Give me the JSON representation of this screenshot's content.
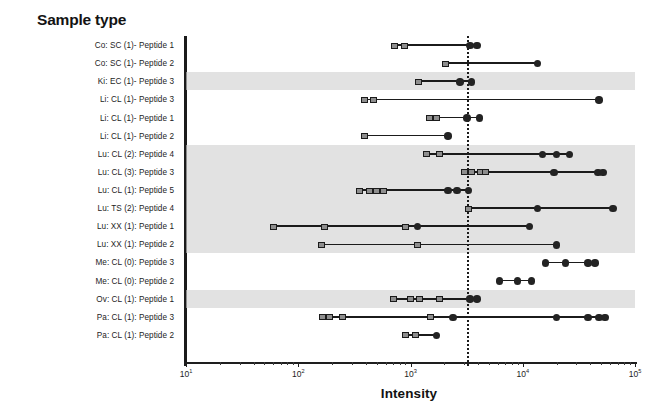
{
  "panel": {
    "title": "Sample type"
  },
  "axis": {
    "x_title": "Intensity",
    "x_scale": "log10",
    "x_min_exp": 1,
    "x_max_exp": 5,
    "x_ticklabels": [
      "10",
      "10",
      "10",
      "10",
      "10"
    ],
    "x_tick_exponents": [
      "1",
      "2",
      "3",
      "4",
      "5"
    ],
    "reference_line_value": 3200
  },
  "style": {
    "band_color": "#d0d0d0",
    "square_fill": "#8e8e8e",
    "square_stroke": "#1b1b1b",
    "circle_fill": "#232323",
    "line_color": "#1b1b1b",
    "refline_color": "#1b1b1b"
  },
  "chart_data": {
    "type": "scatter",
    "title": "Sample type",
    "xlabel": "Intensity",
    "ylabel": "",
    "xscale": "log",
    "xlim": [
      10,
      100000
    ],
    "grid": false,
    "legend": false,
    "reference_line": 3200,
    "marker_kinds": {
      "square": "below-threshold / low replicate",
      "circle": "above-threshold / high replicate"
    },
    "categories": [
      "Co: SC (1)- Peptide 1",
      "Co: SC (1)- Peptide 2",
      "Ki: EC (1)- Peptide 3",
      "Li: CL (1)- Peptide 3",
      "Li: CL (1)- Peptide 1",
      "Li: CL (1)- Peptide 2",
      "Lu: CL (2): Peptide 4",
      "Lu: CL (3): Peptide 3",
      "Lu: CL (1): Peptide 5",
      "Lu: TS (2): Peptide 4",
      "Lu: XX (1): Peptide 1",
      "Lu: XX (1): Peptide 2",
      "Me: CL (0): Peptide 3",
      "Me: CL (0): Peptide 2",
      "Ov: CL (1): Peptide 1",
      "Pa: CL (1): Peptide 3",
      "Pa: CL (1): Peptide 2"
    ],
    "shaded_rows": [
      2,
      6,
      7,
      8,
      9,
      10,
      11,
      14
    ],
    "rows": [
      {
        "category": "Co: SC (1)- Peptide 1",
        "squares": [
          720,
          880
        ],
        "circles": [
          3400,
          3900
        ],
        "line": [
          720,
          3900
        ]
      },
      {
        "category": "Co: SC (1)- Peptide 2",
        "squares": [
          2050
        ],
        "circles": [
          13500
        ],
        "line": [
          2050,
          13500
        ]
      },
      {
        "category": "Ki: EC (1)- Peptide 3",
        "squares": [
          1180
        ],
        "circles": [
          2750,
          3500
        ],
        "line": [
          1180,
          3500
        ]
      },
      {
        "category": "Li: CL (1)- Peptide 3",
        "squares": [
          390,
          470
        ],
        "circles": [
          48000
        ],
        "line": [
          390,
          48000
        ]
      },
      {
        "category": "Li: CL (1)- Peptide 1",
        "squares": [
          1480,
          1700
        ],
        "circles": [
          3200,
          4100
        ],
        "line": [
          1480,
          4100
        ]
      },
      {
        "category": "Li: CL (1)- Peptide 2",
        "squares": [
          390
        ],
        "circles": [
          2150
        ],
        "line": [
          390,
          2150
        ]
      },
      {
        "category": "Lu: CL (2): Peptide 4",
        "squares": [
          1400,
          1800
        ],
        "circles": [
          15000,
          20000,
          26000
        ],
        "line": [
          1400,
          26000
        ]
      },
      {
        "category": "Lu: CL (3): Peptide 3",
        "squares": [
          3000,
          3500,
          4200,
          4700
        ],
        "circles": [
          19000,
          47000,
          52000
        ],
        "line": [
          3000,
          52000
        ]
      },
      {
        "category": "Lu: CL (1): Peptide 5",
        "squares": [
          350,
          430,
          500,
          570
        ],
        "circles": [
          2150,
          2600,
          3300
        ],
        "line": [
          350,
          3300
        ]
      },
      {
        "category": "Lu: TS (2): Peptide 4",
        "squares": [
          3300
        ],
        "circles": [
          13500,
          64000
        ],
        "line": [
          3300,
          64000
        ]
      },
      {
        "category": "Lu: XX (1): Peptide 1",
        "squares": [
          60,
          170,
          900
        ],
        "circles": [
          1150,
          11500
        ],
        "line": [
          60,
          11500
        ]
      },
      {
        "category": "Lu: XX (1): Peptide 2",
        "squares": [
          160,
          1150
        ],
        "circles": [
          20000
        ],
        "line": [
          160,
          20000
        ]
      },
      {
        "category": "Me: CL (0): Peptide 3",
        "squares": [],
        "circles": [
          16000,
          24000,
          38000,
          44000
        ],
        "line": [
          16000,
          44000
        ]
      },
      {
        "category": "Me: CL (0): Peptide 2",
        "squares": [],
        "circles": [
          6200,
          9000,
          12000
        ],
        "line": [
          6200,
          12000
        ]
      },
      {
        "category": "Ov: CL (1): Peptide 1",
        "squares": [
          700,
          1000,
          1200,
          1800
        ],
        "circles": [
          3400,
          3900
        ],
        "line": [
          700,
          3900
        ]
      },
      {
        "category": "Pa: CL (1): Peptide 3",
        "squares": [
          165,
          190,
          250,
          1500
        ],
        "circles": [
          2400,
          20000,
          38000,
          48000,
          54000
        ],
        "line": [
          165,
          54000
        ]
      },
      {
        "category": "Pa: CL (1): Peptide 2",
        "squares": [
          900,
          1100
        ],
        "circles": [
          1700
        ],
        "line": [
          900,
          1700
        ]
      }
    ]
  }
}
